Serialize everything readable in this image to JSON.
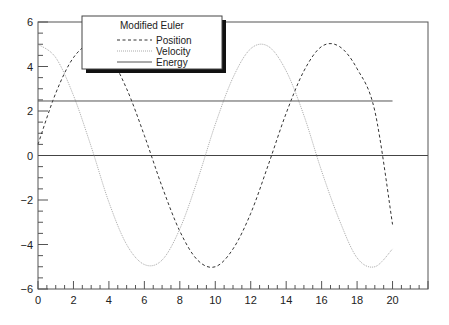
{
  "chart_data": {
    "type": "line",
    "title": "",
    "xlabel": "",
    "ylabel": "",
    "xlim": [
      0,
      22
    ],
    "ylim": [
      -6,
      6
    ],
    "grid": false,
    "x_ticks": [
      0,
      2,
      4,
      6,
      8,
      10,
      12,
      14,
      16,
      18,
      20
    ],
    "y_ticks": [
      -6,
      -4,
      -2,
      0,
      2,
      4,
      6
    ],
    "legend": {
      "title": "Modified Euler",
      "position": "upper-left-inside",
      "entries": [
        {
          "label": "Position",
          "style": "dashed",
          "color": "#333333"
        },
        {
          "label": "Velocity",
          "style": "dotted",
          "color": "#aaaaaa"
        },
        {
          "label": "Energy",
          "style": "solid",
          "color": "#555555"
        }
      ]
    },
    "series": [
      {
        "name": "Position",
        "style": "dashed",
        "color": "#333333",
        "x": [
          0,
          1,
          2,
          3,
          4,
          5,
          6,
          7,
          8,
          9,
          10,
          11,
          12,
          13,
          14,
          15,
          16,
          17,
          18,
          19,
          20
        ],
        "values": [
          0.5,
          2.8,
          4.4,
          5.0,
          4.5,
          3.0,
          0.9,
          -1.4,
          -3.4,
          -4.7,
          -5.0,
          -4.2,
          -2.6,
          -0.4,
          1.9,
          3.8,
          4.9,
          4.9,
          3.9,
          2.0,
          -3.1
        ]
      },
      {
        "name": "Velocity",
        "style": "dotted",
        "color": "#aaaaaa",
        "x": [
          0,
          1,
          2,
          3,
          4,
          5,
          6,
          7,
          8,
          9,
          10,
          11,
          12,
          13,
          14,
          15,
          16,
          17,
          18,
          19,
          20
        ],
        "values": [
          5.0,
          4.4,
          2.7,
          0.4,
          -2.1,
          -4.0,
          -4.9,
          -4.7,
          -3.3,
          -1.1,
          1.4,
          3.5,
          4.8,
          4.9,
          3.8,
          1.8,
          -0.7,
          -2.9,
          -4.6,
          -5.0,
          -4.2
        ]
      },
      {
        "name": "Energy",
        "style": "solid",
        "color": "#555555",
        "x": [
          0,
          20
        ],
        "values": [
          2.45,
          2.45
        ]
      }
    ],
    "reference_lines": [
      {
        "y": 0,
        "style": "solid",
        "color": "#444444",
        "x_range": [
          0,
          22
        ]
      }
    ]
  }
}
